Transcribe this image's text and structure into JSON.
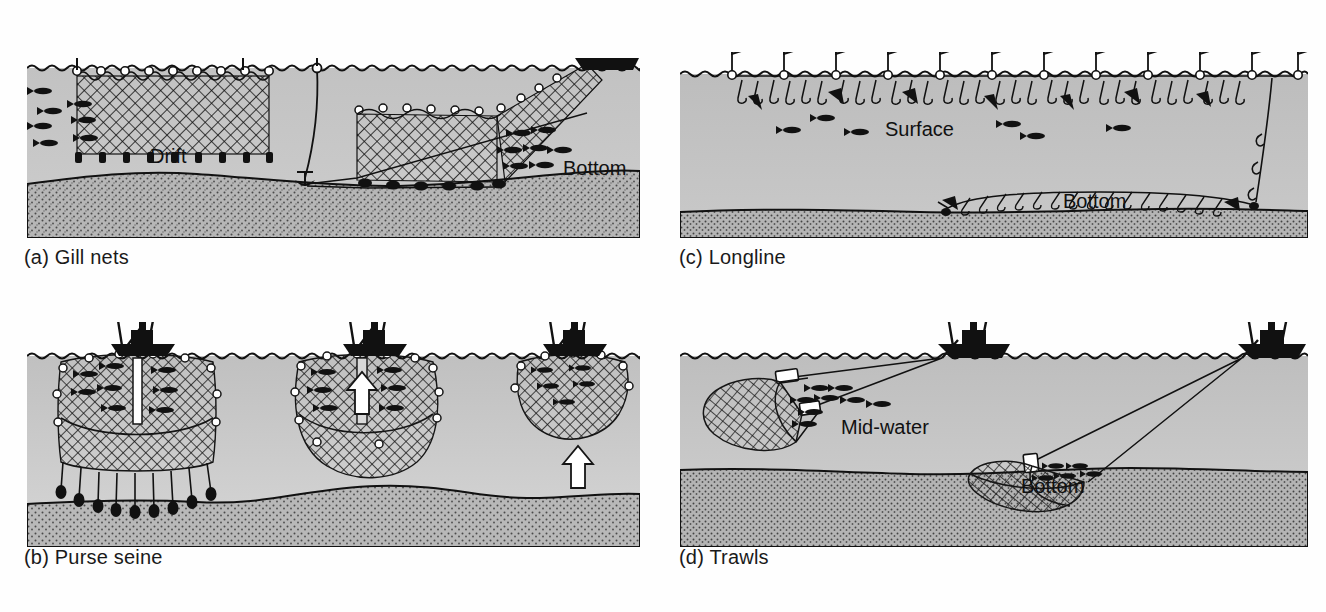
{
  "figure": {
    "kind": "fishing-gear-diagram",
    "background": "#ffffff",
    "panel_count": 4,
    "colors": {
      "water": "#b9b9b9",
      "water_light": "#cfcfcf",
      "seabed": "#b0b0b0",
      "ink": "#111111",
      "page": "#ffffff"
    }
  },
  "panels": [
    {
      "id": "a",
      "caption": "(a) Gill nets",
      "labels": [
        {
          "name": "drift",
          "text": "Drift"
        },
        {
          "name": "bottom",
          "text": "Bottom"
        }
      ]
    },
    {
      "id": "b",
      "caption": "(b) Purse seine",
      "labels": []
    },
    {
      "id": "c",
      "caption": "(c) Longline",
      "labels": [
        {
          "name": "surface",
          "text": "Surface"
        },
        {
          "name": "bottom",
          "text": "Bottom"
        }
      ]
    },
    {
      "id": "d",
      "caption": "(d) Trawls",
      "labels": [
        {
          "name": "mid-water",
          "text": "Mid-water"
        },
        {
          "name": "bottom",
          "text": "Bottom"
        }
      ]
    }
  ]
}
